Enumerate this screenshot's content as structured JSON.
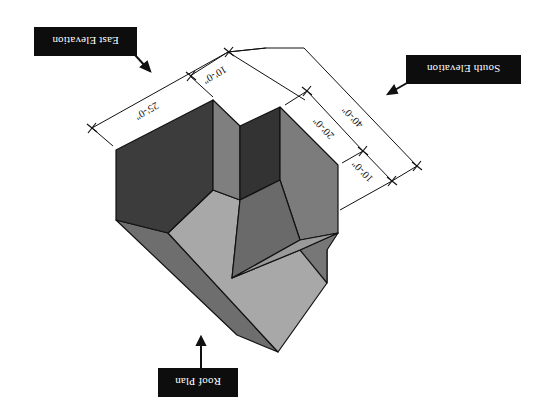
{
  "figure": {
    "orientation": "rotated 180 degrees",
    "colors": {
      "background": "#ffffff",
      "face_darkest": "#3a3a3a",
      "face_dark": "#4a4a4a",
      "face_mid": "#7a7a7a",
      "face_midlight": "#8e8e8e",
      "face_light": "#a8a8a8",
      "edge": "#111111",
      "callout_bg": "#0d0d0d",
      "callout_text": "#ffffff"
    }
  },
  "callouts": {
    "east": "East Elevation",
    "south": "South Elevation",
    "roof": "Roof Plan"
  },
  "dimensions": {
    "d25": "25'-0\"",
    "d10a": "10'-0\"",
    "d40": "40'-0\"",
    "d20": "20'-0\"",
    "d10b": "10'-0\""
  }
}
